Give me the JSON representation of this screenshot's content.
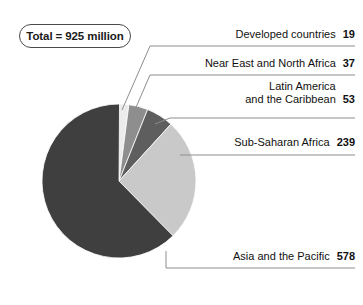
{
  "badge": {
    "text": "Total = 925 million"
  },
  "chart_data": {
    "type": "pie",
    "title": "Total = 925 million",
    "units": "million",
    "total": 925,
    "start_angle_deg": 0,
    "direction": "clockwise",
    "legend_position": "right-callout-labels",
    "categories": [
      "Developed countries",
      "Near East and North Africa",
      "Latin America and the Caribbean",
      "Sub-Saharan Africa",
      "Asia and the Pacific"
    ],
    "values": [
      19,
      37,
      53,
      239,
      578
    ],
    "colors": [
      "#ececec",
      "#8e8e8e",
      "#5e5e5e",
      "#c9c9c9",
      "#3f3f3f"
    ],
    "slices": [
      {
        "label": "Developed countries",
        "label_lines": [
          "Developed countries"
        ],
        "value": "19",
        "numeric": 19,
        "color": "#ececec",
        "percent": 2.1
      },
      {
        "label": "Near East and North Africa",
        "label_lines": [
          "Near East and North Africa"
        ],
        "value": "37",
        "numeric": 37,
        "color": "#8e8e8e",
        "percent": 4.0
      },
      {
        "label": "Latin America and the Caribbean",
        "label_lines": [
          "Latin America",
          "and the Caribbean"
        ],
        "value": "53",
        "numeric": 53,
        "color": "#5e5e5e",
        "percent": 5.7
      },
      {
        "label": "Sub-Saharan Africa",
        "label_lines": [
          "Sub-Saharan Africa"
        ],
        "value": "239",
        "numeric": 239,
        "color": "#c9c9c9",
        "percent": 25.8
      },
      {
        "label": "Asia and the Pacific",
        "label_lines": [
          "Asia and the Pacific"
        ],
        "value": "578",
        "numeric": 578,
        "color": "#3f3f3f",
        "percent": 62.5
      }
    ]
  },
  "labels": {
    "l1": {
      "text": "Developed countries",
      "value": "19"
    },
    "l2": {
      "text": "Near East and North Africa",
      "value": "37"
    },
    "l3": {
      "line1": "Latin America",
      "line2": "and the Caribbean",
      "value": "53"
    },
    "l4": {
      "text": "Sub-Saharan Africa",
      "value": "239"
    },
    "l5": {
      "text": "Asia and the Pacific",
      "value": "578"
    }
  }
}
